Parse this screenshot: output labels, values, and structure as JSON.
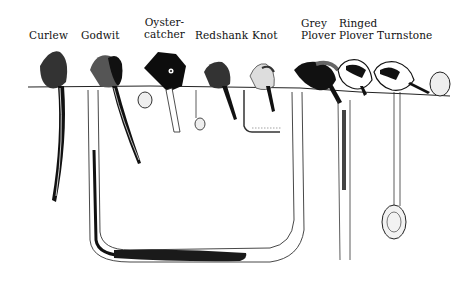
{
  "diagram": {
    "birds": [
      {
        "name": "Curlew"
      },
      {
        "name": "Godwit"
      },
      {
        "name": "Oyster-\ncatcher",
        "line1": "Oyster-",
        "line2": "catcher"
      },
      {
        "name": "Redshank"
      },
      {
        "name": "Knot"
      },
      {
        "name": "Grey Plover",
        "line1": "Grey",
        "line2": "Plover"
      },
      {
        "name": "Ringed Plover",
        "line1": "Ringed",
        "line2": "Plover"
      },
      {
        "name": "Turnstone"
      }
    ],
    "prey": [
      "lugworm",
      "cockle",
      "tellin",
      "mussel",
      "ragworm",
      "periwinkle",
      "snail",
      "hydrobia"
    ],
    "colors": {
      "ink": "#111111",
      "background": "#ffffff"
    }
  }
}
